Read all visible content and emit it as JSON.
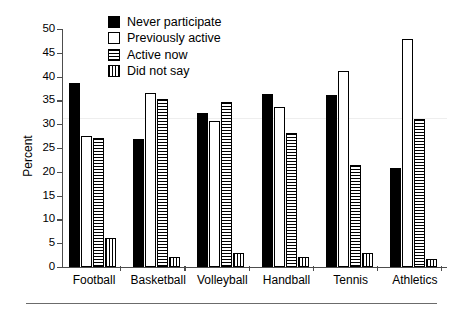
{
  "chart_data": {
    "type": "bar",
    "title": "",
    "subtitle": "",
    "xlabel": "",
    "ylabel": "Percent",
    "ylim": [
      0,
      50
    ],
    "yticks": [
      0,
      5,
      10,
      15,
      20,
      25,
      30,
      35,
      40,
      45,
      50
    ],
    "grid": false,
    "legend_position": "top-center",
    "categories": [
      "Football",
      "Basketball",
      "Volleyball",
      "Handball",
      "Tennis",
      "Athletics"
    ],
    "series": [
      {
        "name": "Never participate",
        "pattern": "solid-black",
        "color": "#000000",
        "values": [
          38.7,
          26.8,
          32.3,
          36.4,
          36.1,
          20.8
        ]
      },
      {
        "name": "Previously active",
        "pattern": "open-white",
        "color": "#ffffff",
        "values": [
          27.6,
          36.6,
          30.6,
          33.7,
          41.2,
          47.8
        ]
      },
      {
        "name": "Active now",
        "pattern": "horizontal-stripes",
        "color": "#000000",
        "values": [
          27.0,
          35.2,
          34.7,
          28.2,
          21.4,
          31.2
        ]
      },
      {
        "name": "Did not say",
        "pattern": "vertical-stripes",
        "color": "#000000",
        "values": [
          6.0,
          2.1,
          2.9,
          2.1,
          2.9,
          1.6
        ]
      }
    ]
  },
  "axis": {
    "y_title": "Percent",
    "tick_labels": [
      "0",
      "5",
      "10",
      "15",
      "20",
      "25",
      "30",
      "35",
      "40",
      "45",
      "50"
    ]
  },
  "legend": {
    "entries": [
      {
        "label": "Never participate"
      },
      {
        "label": "Previously active"
      },
      {
        "label": "Active now"
      },
      {
        "label": "Did not say"
      }
    ]
  }
}
